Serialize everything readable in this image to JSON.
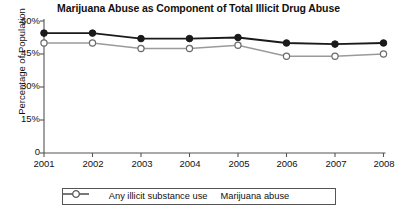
{
  "chart_data": {
    "type": "line",
    "title": "Marijuana Abuse as Component of Total Illicit Drug Abuse",
    "xlabel": "",
    "ylabel": "Percentage of Population",
    "categories": [
      "2001",
      "2002",
      "2003",
      "2004",
      "2005",
      "2006",
      "2007",
      "2008"
    ],
    "x": [
      2001,
      2002,
      2003,
      2004,
      2005,
      2006,
      2007,
      2008
    ],
    "ylim": [
      0,
      60
    ],
    "yticks": [
      0,
      15,
      30,
      45,
      60
    ],
    "ytick_labels": [
      "0",
      "15%",
      "30%",
      "45%",
      "60%"
    ],
    "grid": false,
    "legend_position": "bottom",
    "series": [
      {
        "name": "Any illicit substance use",
        "marker": "filled-circle",
        "color": "#1a1a1a",
        "values": [
          54.5,
          54.5,
          52.0,
          52.0,
          52.5,
          50.0,
          49.5,
          50.0
        ]
      },
      {
        "name": "Marijuana abuse",
        "marker": "open-circle",
        "color": "#9a9a9a",
        "values": [
          50.0,
          50.0,
          47.5,
          47.5,
          49.0,
          44.0,
          44.0,
          45.0
        ]
      }
    ]
  },
  "legend": {
    "items": [
      {
        "label": "Any illicit substance use",
        "marker": "filled-circle-icon"
      },
      {
        "label": "Marijuana abuse",
        "marker": "open-circle-icon"
      }
    ]
  },
  "colors": {
    "series_dark": "#1a1a1a",
    "series_light": "#9a9a9a",
    "axis": "#555555",
    "text": "#111111",
    "background": "#ffffff"
  }
}
